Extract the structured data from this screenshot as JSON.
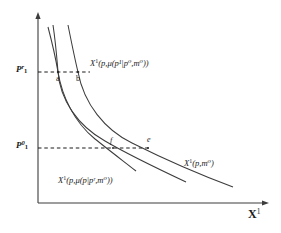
{
  "figure": {
    "type": "demand-curve-diagram",
    "background_color": "#ffffff",
    "line_color": "#3c3c3c"
  },
  "axes": {
    "x_axis": {
      "title": "X",
      "title_superscript": "1",
      "arrow": true
    },
    "y_axis": {
      "arrow": true
    },
    "price_ticks": [
      {
        "id": "upper",
        "base": "P",
        "subscript": "1",
        "superscript": "r",
        "value_y": 72
      },
      {
        "id": "lower",
        "base": "P",
        "subscript": "1",
        "superscript": "0",
        "value_y": 148
      }
    ]
  },
  "curves": [
    {
      "id": "compensated-p1",
      "label": {
        "fn": "X",
        "fn_sup": "1",
        "expression": "(p,μ(p¹|p⁰,m⁰))"
      },
      "label_text": "X¹(p,μ(p¹|p⁰,m⁰))"
    },
    {
      "id": "marshallian",
      "label": {
        "fn": "X",
        "fn_sup": "1",
        "expression": "(p,m⁰)"
      },
      "label_text": "X¹(p,m⁰)"
    },
    {
      "id": "compensated-pr",
      "label": {
        "fn": "X",
        "fn_sup": "1",
        "expression": "(p,μ(p|pʳ,m⁰))"
      },
      "label_text": "X¹(p,μ(p|pʳ,m⁰))"
    }
  ],
  "points": [
    {
      "id": "a",
      "label": "a",
      "x": 58,
      "y": 72
    },
    {
      "id": "b",
      "label": "b",
      "x": 78,
      "y": 72
    },
    {
      "id": "f",
      "label": "f",
      "x": 113,
      "y": 148
    },
    {
      "id": "e",
      "label": "e",
      "x": 148,
      "y": 148
    }
  ],
  "guide_lines": [
    {
      "id": "upper-dashed",
      "y": 72,
      "from_x": 38,
      "to_x": 90
    },
    {
      "id": "lower-dashed",
      "y": 148,
      "from_x": 38,
      "to_x": 150
    }
  ]
}
